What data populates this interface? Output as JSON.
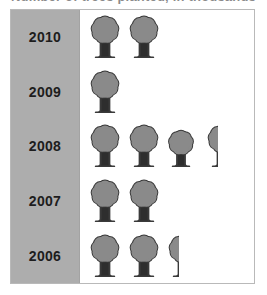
{
  "title": {
    "text": "Number of trees planted, in thousands",
    "note": "clipped at top edge of screenshot, largely illegible"
  },
  "colors": {
    "sidebar": "#adadad",
    "plot_background": "#ffffff",
    "frame_border": "#b9b9b9",
    "tree_fill": "#8a8a8a",
    "tree_outline": "#3a3a3a",
    "trunk": "#2e2e2e",
    "label_text": "#1d1d1d"
  },
  "chart_data": {
    "type": "bar",
    "chart_style": "pictograph",
    "title": "Number of trees planted, in thousands",
    "xlabel": "",
    "ylabel": "",
    "categories": [
      "2010",
      "2009",
      "2008",
      "2007",
      "2006"
    ],
    "values": [
      2,
      1,
      3.4,
      2,
      2.4
    ],
    "icon": "tree-icon",
    "grid": false,
    "legend": false,
    "xlim": [
      0,
      4
    ],
    "rows": [
      {
        "year": "2010",
        "value": 2,
        "full_icons": 2,
        "partial_fraction": 0,
        "icons": [
          {
            "kind": "full",
            "fraction": 1,
            "size": "normal"
          },
          {
            "kind": "full",
            "fraction": 1,
            "size": "normal"
          }
        ]
      },
      {
        "year": "2009",
        "value": 1,
        "full_icons": 1,
        "partial_fraction": 0,
        "icons": [
          {
            "kind": "full",
            "fraction": 1,
            "size": "normal"
          }
        ]
      },
      {
        "year": "2008",
        "value": 3.4,
        "full_icons": 3,
        "partial_fraction": 0.4,
        "icons": [
          {
            "kind": "full",
            "fraction": 1,
            "size": "normal"
          },
          {
            "kind": "full",
            "fraction": 1,
            "size": "normal"
          },
          {
            "kind": "full",
            "fraction": 1,
            "size": "small"
          },
          {
            "kind": "partial",
            "fraction": 0.4,
            "size": "normal"
          }
        ]
      },
      {
        "year": "2007",
        "value": 2,
        "full_icons": 2,
        "partial_fraction": 0,
        "icons": [
          {
            "kind": "full",
            "fraction": 1,
            "size": "normal"
          },
          {
            "kind": "full",
            "fraction": 1,
            "size": "normal"
          }
        ]
      },
      {
        "year": "2006",
        "value": 2.4,
        "full_icons": 2,
        "partial_fraction": 0.4,
        "icons": [
          {
            "kind": "full",
            "fraction": 1,
            "size": "normal"
          },
          {
            "kind": "full",
            "fraction": 1,
            "size": "normal"
          },
          {
            "kind": "partial",
            "fraction": 0.4,
            "size": "normal"
          }
        ]
      }
    ]
  }
}
